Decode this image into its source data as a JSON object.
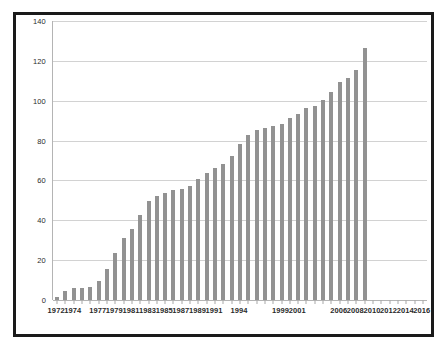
{
  "chart_data": {
    "type": "bar",
    "title": "",
    "subtitle": "",
    "xlabel": "",
    "ylabel": "",
    "ylim": [
      0,
      140
    ],
    "yticks": [
      0,
      20,
      40,
      60,
      80,
      100,
      120,
      140
    ],
    "ytick_labels": [
      "0",
      "20",
      "40",
      "60",
      "80",
      "100",
      "120",
      "140"
    ],
    "grid": true,
    "legend": false,
    "legend_position": "none",
    "bar_color": "#929292",
    "background_color": "#ffffff",
    "gridline_color": "#d2d2d2",
    "frame_color": "#1a1a1a",
    "categories": [
      "1972",
      "1973",
      "1974",
      "1975",
      "1976",
      "1977",
      "1978",
      "1979",
      "1980",
      "1981",
      "1982",
      "1983",
      "1984",
      "1985",
      "1986",
      "1987",
      "1988",
      "1989",
      "1990",
      "1991",
      "1992",
      "1993",
      "1994",
      "1995",
      "1996",
      "1997",
      "1998",
      "1999",
      "2000",
      "2001",
      "2002",
      "2003",
      "2004",
      "2005",
      "2006",
      "2007",
      "2008",
      "2009",
      "2010",
      "2011",
      "2012",
      "2013",
      "2014",
      "2015",
      "2016"
    ],
    "values": [
      1.5,
      4.5,
      5.8,
      6.2,
      6.3,
      9.7,
      15.6,
      23.6,
      31.1,
      35.7,
      42.7,
      49.8,
      52.0,
      53.8,
      55.0,
      55.7,
      57.0,
      60.8,
      63.5,
      66.2,
      68.5,
      72.4,
      78.5,
      83.0,
      85.3,
      86.1,
      87.2,
      88.2,
      91.2,
      93.1,
      96.3,
      97.4,
      100.3,
      104.6,
      109.5,
      111.6,
      115.5,
      126.4,
      0,
      0,
      0,
      0,
      0,
      0,
      0
    ],
    "visible_xtick_labels": [
      {
        "category": "1972",
        "label": "1972"
      },
      {
        "category": "1974",
        "label": "1974"
      },
      {
        "category": "1977",
        "label": "1977"
      },
      {
        "category": "1979",
        "label": "1979"
      },
      {
        "category": "1981",
        "label": "1981"
      },
      {
        "category": "1983",
        "label": "1983"
      },
      {
        "category": "1985",
        "label": "1985"
      },
      {
        "category": "1987",
        "label": "1987"
      },
      {
        "category": "1989",
        "label": "1989"
      },
      {
        "category": "1991",
        "label": "1991"
      },
      {
        "category": "1994",
        "label": "1994"
      },
      {
        "category": "1999",
        "label": "1999"
      },
      {
        "category": "2001",
        "label": "2001"
      },
      {
        "category": "2006",
        "label": "2006"
      },
      {
        "category": "2008",
        "label": "2008"
      },
      {
        "category": "2010",
        "label": "2010"
      },
      {
        "category": "2012",
        "label": "2012"
      },
      {
        "category": "2014",
        "label": "2014"
      },
      {
        "category": "2016",
        "label": "2016"
      }
    ]
  }
}
